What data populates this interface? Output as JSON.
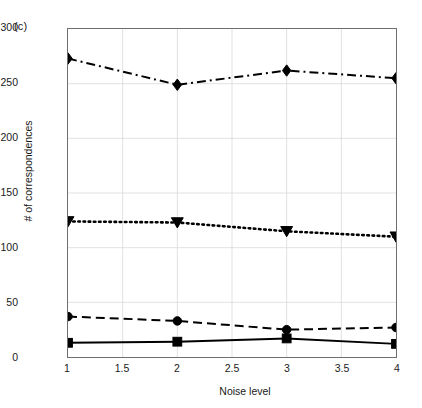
{
  "panel": {
    "label": "(c)"
  },
  "chart_data": {
    "type": "line",
    "title": "",
    "xlabel": "Noise level",
    "ylabel": "# of correspondences",
    "x": [
      1,
      2,
      3,
      4
    ],
    "xlim": [
      1,
      4
    ],
    "ylim": [
      0,
      300
    ],
    "xticks": [
      1,
      1.5,
      2,
      2.5,
      3,
      3.5,
      4
    ],
    "xticklabels": [
      "1",
      "1.5",
      "2",
      "2.5",
      "3",
      "3.5",
      "4"
    ],
    "yticks": [
      0,
      50,
      100,
      150,
      200,
      250,
      300
    ],
    "yticklabels": [
      "0",
      "50",
      "100",
      "150",
      "200",
      "250",
      "300"
    ],
    "grid": true,
    "legend": "none",
    "series": [
      {
        "name": "diamond-dashdot",
        "marker": "diamond",
        "linestyle": "dash-dot",
        "color": "#000000",
        "values": [
          273,
          249,
          262,
          255
        ]
      },
      {
        "name": "triangle-dotted",
        "marker": "triangle-down",
        "linestyle": "dotted",
        "color": "#000000",
        "values": [
          124,
          123,
          115,
          110
        ]
      },
      {
        "name": "circle-dashed",
        "marker": "circle",
        "linestyle": "dashed",
        "color": "#000000",
        "values": [
          37,
          33,
          25,
          27
        ]
      },
      {
        "name": "square-solid",
        "marker": "square",
        "linestyle": "solid",
        "color": "#000000",
        "values": [
          13,
          14,
          17,
          12
        ]
      }
    ]
  },
  "colors": {
    "axis": "#6e6e6e",
    "grid": "#d9d9d9",
    "series": "#000000",
    "background": "#ffffff"
  }
}
